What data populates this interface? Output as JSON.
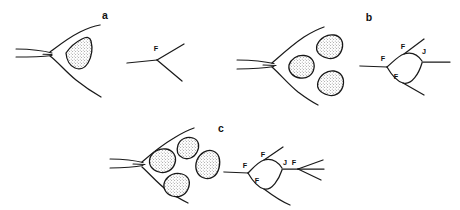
{
  "figure": {
    "background_color": "#ffffff",
    "ink_color": "#1a1a1a",
    "width": 460,
    "height": 210,
    "panels": [
      {
        "id": "a",
        "label": "a",
        "label_x": 105,
        "label_y": 19,
        "blob_count": 1,
        "schematic_labels": [
          {
            "text": "F",
            "x": 156,
            "y": 51
          }
        ]
      },
      {
        "id": "b",
        "label": "b",
        "label_x": 369,
        "label_y": 21,
        "blob_count": 3,
        "schematic_labels": [
          {
            "text": "F",
            "x": 383,
            "y": 61
          },
          {
            "text": "F",
            "x": 403,
            "y": 49
          },
          {
            "text": "J",
            "x": 424,
            "y": 54
          },
          {
            "text": "F",
            "x": 396,
            "y": 79
          }
        ]
      },
      {
        "id": "c",
        "label": "c",
        "label_x": 221,
        "label_y": 132,
        "blob_count": 4,
        "schematic_labels": [
          {
            "text": "F",
            "x": 245,
            "y": 168
          },
          {
            "text": "F",
            "x": 263,
            "y": 157
          },
          {
            "text": "J",
            "x": 285,
            "y": 165
          },
          {
            "text": "F",
            "x": 294,
            "y": 165
          },
          {
            "text": "F",
            "x": 257,
            "y": 183
          }
        ]
      }
    ],
    "legend_symbols": [
      {
        "symbol": "F",
        "meaning": "F"
      },
      {
        "symbol": "J",
        "meaning": "J"
      }
    ]
  }
}
